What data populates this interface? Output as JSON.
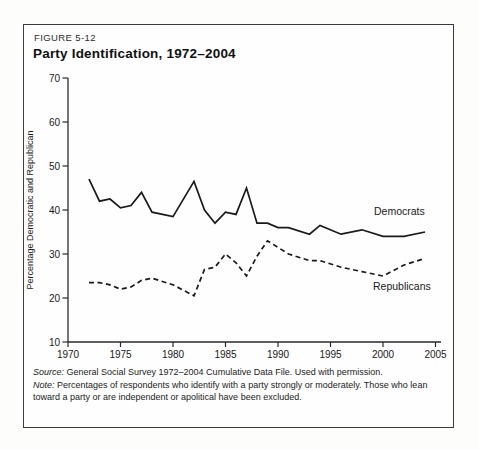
{
  "figure": {
    "label": "FIGURE 5-12",
    "title": "Party Identification, 1972–2004"
  },
  "chart_data": {
    "type": "line",
    "title": "Party Identification, 1972–2004",
    "xlabel": "",
    "ylabel": "Percentage Democratic and Republican",
    "xlim": [
      1970,
      2005
    ],
    "ylim": [
      10,
      70
    ],
    "xticks": [
      1970,
      1975,
      1980,
      1985,
      1990,
      1995,
      2000,
      2005
    ],
    "yticks": [
      10,
      20,
      30,
      40,
      50,
      60,
      70
    ],
    "grid": false,
    "legend_position": "inline-labels",
    "x": [
      1972,
      1973,
      1974,
      1975,
      1976,
      1977,
      1978,
      1980,
      1982,
      1983,
      1984,
      1985,
      1986,
      1987,
      1988,
      1989,
      1990,
      1991,
      1993,
      1994,
      1996,
      1998,
      2000,
      2002,
      2004
    ],
    "series": [
      {
        "name": "Democrats",
        "style": "solid",
        "label_pos": [
          374,
          215
        ],
        "values": [
          47,
          42,
          42.5,
          40.5,
          41,
          44,
          39.5,
          38.5,
          46.5,
          40,
          37,
          39.5,
          39,
          45,
          37,
          37,
          36,
          36,
          34.5,
          36.5,
          34.5,
          35.5,
          34,
          34,
          35
        ]
      },
      {
        "name": "Republicans",
        "style": "dashed",
        "label_pos": [
          373,
          290
        ],
        "values": [
          23.5,
          23.5,
          23,
          22,
          22.5,
          24,
          24.5,
          23,
          20.5,
          26.5,
          27,
          30,
          28,
          25,
          29.5,
          33,
          31.5,
          30,
          28.5,
          28.5,
          27,
          26,
          25,
          27.5,
          29
        ]
      }
    ]
  },
  "footnotes": {
    "source_label": "Source:",
    "source_text": " General Social Survey 1972–2004 Cumulative Data File. Used with permission.",
    "note_label": "Note:",
    "note_text": " Percentages of respondents who identify with a party strongly or moderately. Those who lean toward a party or are independent or apolitical have been excluded."
  },
  "colors": {
    "line": "#1a1a1a",
    "axis": "#2a2a2a",
    "text": "#1a1a1a",
    "border": "#3a3a3a",
    "background": "#fefefe"
  }
}
